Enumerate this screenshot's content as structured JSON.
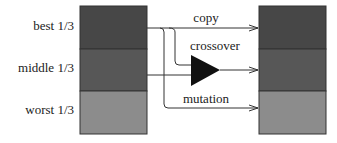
{
  "left_population": {
    "segments": [
      {
        "label": "best 1/3",
        "color": "#474747"
      },
      {
        "label": "middle 1/3",
        "color": "#575757"
      },
      {
        "label": "worst 1/3",
        "color": "#8c8c8c"
      }
    ]
  },
  "right_population": {
    "segments": [
      {
        "color": "#474747"
      },
      {
        "color": "#575757"
      },
      {
        "color": "#8c8c8c"
      }
    ]
  },
  "operations": {
    "copy": "copy",
    "crossover": "crossover",
    "mutation": "mutation"
  },
  "colors": {
    "line": "#333333",
    "operator": "#111111"
  }
}
